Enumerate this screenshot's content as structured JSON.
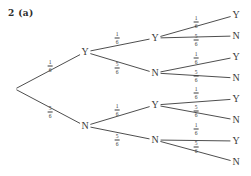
{
  "title": "2 (a)",
  "chart_data": {
    "type": "diagram",
    "diagram_type": "probability-tree",
    "title": "2 (a)",
    "levels": 3,
    "outcome_labels": [
      "Y",
      "N"
    ],
    "probabilities": {
      "Y": "1/6",
      "N": "5/6"
    },
    "root": {
      "x": 15,
      "y": 89
    },
    "branches": [
      {
        "id": "b1",
        "from": "root",
        "to": "n1",
        "label_num": "1",
        "label_den": "6",
        "label_x": 50,
        "label_y": 66
      },
      {
        "id": "b2",
        "from": "root",
        "to": "n2",
        "label_num": "5",
        "label_den": "6",
        "label_x": 50,
        "label_y": 112
      },
      {
        "id": "b3",
        "from": "n1",
        "to": "n3",
        "label_num": "1",
        "label_den": "6",
        "label_x": 117,
        "label_y": 38
      },
      {
        "id": "b4",
        "from": "n1",
        "to": "n4",
        "label_num": "5",
        "label_den": "6",
        "label_x": 117,
        "label_y": 68
      },
      {
        "id": "b5",
        "from": "n2",
        "to": "n5",
        "label_num": "1",
        "label_den": "6",
        "label_x": 117,
        "label_y": 110
      },
      {
        "id": "b6",
        "from": "n2",
        "to": "n6",
        "label_num": "5",
        "label_den": "6",
        "label_x": 117,
        "label_y": 140
      },
      {
        "id": "b7",
        "from": "n3",
        "to": "l1",
        "label_num": "1",
        "label_den": "6",
        "label_x": 196,
        "label_y": 22
      },
      {
        "id": "b8",
        "from": "n3",
        "to": "l2",
        "label_num": "5",
        "label_den": "6",
        "label_x": 196,
        "label_y": 40
      },
      {
        "id": "b9",
        "from": "n4",
        "to": "l3",
        "label_num": "1",
        "label_den": "6",
        "label_x": 196,
        "label_y": 58
      },
      {
        "id": "b10",
        "from": "n4",
        "to": "l4",
        "label_num": "5",
        "label_den": "6",
        "label_x": 196,
        "label_y": 76
      },
      {
        "id": "b11",
        "from": "n5",
        "to": "l5",
        "label_num": "1",
        "label_den": "6",
        "label_x": 196,
        "label_y": 93
      },
      {
        "id": "b12",
        "from": "n5",
        "to": "l6",
        "label_num": "5",
        "label_den": "6",
        "label_x": 196,
        "label_y": 111
      },
      {
        "id": "b13",
        "from": "n6",
        "to": "l7",
        "label_num": "1",
        "label_den": "6",
        "label_x": 196,
        "label_y": 129
      },
      {
        "id": "b14",
        "from": "n6",
        "to": "l8",
        "label_num": "5",
        "label_den": "6",
        "label_x": 196,
        "label_y": 147
      }
    ],
    "nodes": [
      {
        "id": "n1",
        "label": "Y",
        "x": 85,
        "y": 52
      },
      {
        "id": "n2",
        "label": "N",
        "x": 85,
        "y": 126
      },
      {
        "id": "n3",
        "label": "Y",
        "x": 155,
        "y": 38
      },
      {
        "id": "n4",
        "label": "N",
        "x": 155,
        "y": 73
      },
      {
        "id": "n5",
        "label": "Y",
        "x": 155,
        "y": 105
      },
      {
        "id": "n6",
        "label": "N",
        "x": 155,
        "y": 140
      },
      {
        "id": "l1",
        "label": "Y",
        "x": 236,
        "y": 15
      },
      {
        "id": "l2",
        "label": "N",
        "x": 236,
        "y": 36
      },
      {
        "id": "l3",
        "label": "Y",
        "x": 236,
        "y": 57
      },
      {
        "id": "l4",
        "label": "N",
        "x": 236,
        "y": 78
      },
      {
        "id": "l5",
        "label": "Y",
        "x": 236,
        "y": 99
      },
      {
        "id": "l6",
        "label": "N",
        "x": 236,
        "y": 120
      },
      {
        "id": "l7",
        "label": "Y",
        "x": 236,
        "y": 141
      },
      {
        "id": "l8",
        "label": "N",
        "x": 236,
        "y": 162
      }
    ]
  }
}
